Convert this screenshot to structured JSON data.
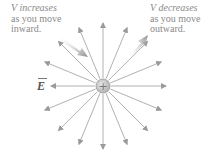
{
  "captions": {
    "left": {
      "symbol": "V",
      "line1_rest": " increases",
      "line2": "as you move",
      "line3": "inward."
    },
    "right": {
      "symbol": "V",
      "line1_rest": " decreases",
      "line2": "as you move",
      "line3": "outward."
    }
  },
  "field_label": "E",
  "charge": {
    "sign": "+"
  },
  "field_lines": {
    "count": 16,
    "direction": "outward"
  },
  "gradient_arrows": [
    {
      "name": "inward-arrow",
      "meaning": "V increases inward",
      "direction": "toward charge"
    },
    {
      "name": "outward-arrow",
      "meaning": "V decreases outward",
      "direction": "away from charge"
    }
  ],
  "colors": {
    "line": "#a8a8a8",
    "text": "#8a8a8a",
    "charge_fill": "#c8c8c8",
    "charge_stroke": "#9a9a9a"
  }
}
